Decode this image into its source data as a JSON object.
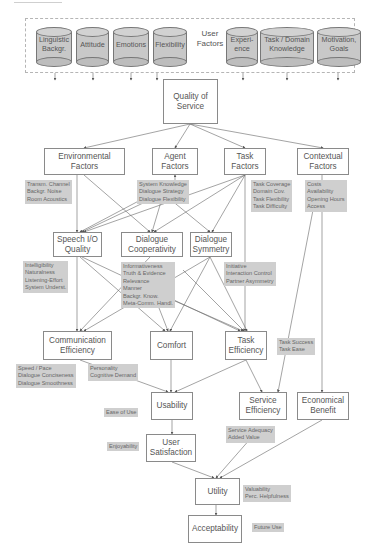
{
  "diagram": {
    "top_partial_text": "of Model",
    "user_factors": {
      "label": "User Factors",
      "items": [
        {
          "label": "Linguistic Backgr."
        },
        {
          "label": "Attitude"
        },
        {
          "label": "Emotions"
        },
        {
          "label": "Flexibility"
        },
        {
          "label": "Experi- ence"
        },
        {
          "label": "Task / Domain Knowledge"
        },
        {
          "label": "Motivation, Goals"
        }
      ]
    },
    "nodes": {
      "quality_of_service": "Quality of Service",
      "environmental_factors": "Environmental Factors",
      "agent_factors": "Agent Factors",
      "task_factors": "Task Factors",
      "contextual_factors": "Contextual Factors",
      "speech_io_quality": "Speech I/O Quality",
      "dialogue_cooperativity": "Dialogue Cooperativity",
      "dialogue_symmetry": "Dialogue Symmetry",
      "communication_efficiency": "Communication Efficiency",
      "comfort": "Comfort",
      "task_efficiency": "Task Efficiency",
      "usability": "Usability",
      "service_efficiency": "Service Efficiency",
      "economical_benefit": "Economical Benefit",
      "user_satisfaction": "User Satisfaction",
      "utility": "Utility",
      "acceptability": "Acceptability"
    },
    "attributes": {
      "environmental": [
        "Transm. Channel",
        "Backgr. Noise",
        "Room Acoustics"
      ],
      "agent": [
        "System Knowledge",
        "Dialogue Strategy",
        "Dialogue Flexibility"
      ],
      "task": [
        "Task Coverage",
        "Domain Cov.",
        "Task Flexibility",
        "Task Difficulty"
      ],
      "contextual": [
        "Costs",
        "Availability",
        "Opening Hours",
        "Access"
      ],
      "speech_io": [
        "Intelligibility",
        "Naturalness",
        "Listening-Effort",
        "System Underst."
      ],
      "cooperativity": [
        "Informativeness",
        "Truth & Evidence",
        "Relevance",
        "Manner",
        "Backgr. Know.",
        "Meta-Comm. Handl."
      ],
      "symmetry": [
        "Initiative",
        "Interaction Control",
        "Partner Asymmetry"
      ],
      "communication_efficiency": [
        "Speed / Pace",
        "Dialogue Conciseness",
        "Dialogue Smoothness"
      ],
      "comfort": [
        "Personality",
        "Cognitive Demand"
      ],
      "task_efficiency": [
        "Task Success",
        "Task Ease"
      ],
      "usability": [
        "Ease of Use"
      ],
      "service_efficiency": [
        "Service Adequacy",
        "Added Value"
      ],
      "user_satisfaction": [
        "Enjoyability"
      ],
      "utility": [
        "Valuability",
        "Perc. Helpfulness"
      ],
      "acceptability": [
        "Future Use"
      ]
    },
    "colors": {
      "node_border": "#8a8a8a",
      "attr_fill": "#cfcfcf",
      "cylinder_fill": "#c8c8c8",
      "arrow": "#555555",
      "text": "#555555"
    }
  }
}
